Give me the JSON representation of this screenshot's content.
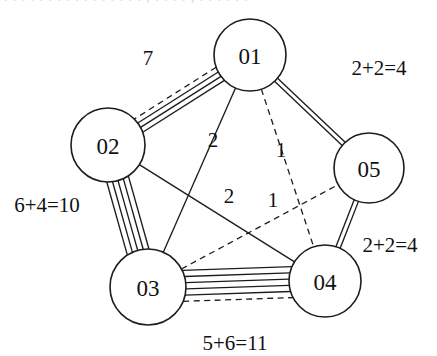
{
  "figure": {
    "kind": "undirected-multigraph",
    "clipped_header_text": ". . . . . . . . . . . . . . . .  ,  . . . .  ,  . .  . . . .",
    "width": 437,
    "height": 356,
    "background": "#ffffff",
    "stroke_color": "#1c1c1c"
  },
  "nodes": [
    {
      "id": "n1",
      "label": "01",
      "cx": 250,
      "cy": 55,
      "r": 36
    },
    {
      "id": "n2",
      "label": "02",
      "cx": 108,
      "cy": 145,
      "r": 37
    },
    {
      "id": "n3",
      "label": "03",
      "cx": 148,
      "cy": 287,
      "r": 38
    },
    {
      "id": "n4",
      "label": "04",
      "cx": 325,
      "cy": 281,
      "r": 36
    },
    {
      "id": "n5",
      "label": "05",
      "cx": 369,
      "cy": 168,
      "r": 35
    }
  ],
  "edges": [
    {
      "id": "e-01-02",
      "from": "n1",
      "to": "n2",
      "solid_count": 3,
      "dashed_count": 1,
      "spacing": 5.2,
      "label": "7",
      "label_x": 148,
      "label_y": 58
    },
    {
      "id": "e-02-03",
      "from": "n2",
      "to": "n3",
      "solid_count": 5,
      "dashed_count": 0,
      "spacing": 5.6,
      "label": "6+4=10",
      "label_x": 47,
      "label_y": 205
    },
    {
      "id": "e-03-04",
      "from": "n3",
      "to": "n4",
      "solid_count": 5,
      "dashed_count": 1,
      "spacing": 6.2,
      "label": "5+6=11",
      "label_x": 235,
      "label_y": 343
    },
    {
      "id": "e-01-05",
      "from": "n1",
      "to": "n5",
      "solid_count": 2,
      "dashed_count": 0,
      "spacing": 4.4,
      "label": "2+2=4",
      "label_x": 379,
      "label_y": 68
    },
    {
      "id": "e-05-04",
      "from": "n5",
      "to": "n4",
      "solid_count": 2,
      "dashed_count": 0,
      "spacing": 4.6,
      "label": "2+2=4",
      "label_x": 390,
      "label_y": 245
    },
    {
      "id": "e-01-03",
      "from": "n1",
      "to": "n3",
      "solid_count": 1,
      "dashed_count": 0,
      "spacing": 0,
      "label": "2",
      "label_x": 213,
      "label_y": 140
    },
    {
      "id": "e-02-04",
      "from": "n2",
      "to": "n4",
      "solid_count": 1,
      "dashed_count": 0,
      "spacing": 0,
      "label": "2",
      "label_x": 229,
      "label_y": 196
    },
    {
      "id": "e-01-04",
      "from": "n1",
      "to": "n4",
      "solid_count": 0,
      "dashed_count": 1,
      "spacing": 0,
      "label": "1",
      "label_x": 281,
      "label_y": 150
    },
    {
      "id": "e-03-05",
      "from": "n3",
      "to": "n5",
      "solid_count": 0,
      "dashed_count": 1,
      "spacing": 0,
      "label": "1",
      "label_x": 273,
      "label_y": 200
    }
  ],
  "labels": {
    "edge_01_02": "7",
    "edge_02_03": "6+4=10",
    "edge_03_04": "5+6=11",
    "edge_01_05": "2+2=4",
    "edge_05_04": "2+2=4",
    "edge_01_03": "2",
    "edge_02_04": "2",
    "edge_01_04": "1",
    "edge_03_05": "1"
  }
}
